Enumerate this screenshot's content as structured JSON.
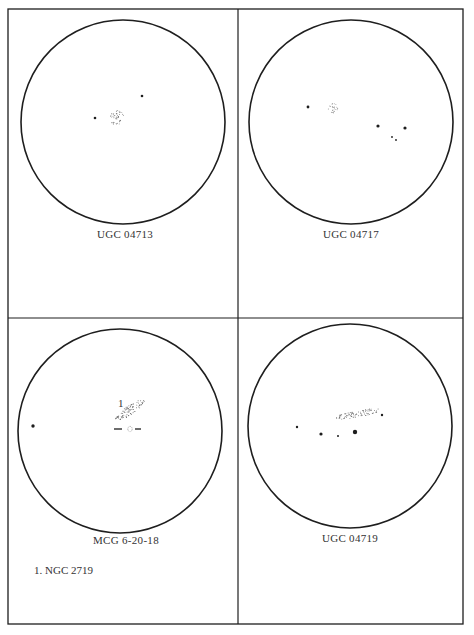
{
  "panels": [
    {
      "id": "top-left",
      "title": "UGC 04713",
      "circle": {
        "cx": 123,
        "cy": 122,
        "r": 102
      },
      "label_pos": {
        "x": 125,
        "y": 236
      },
      "galaxy": {
        "shape": "round",
        "cx": 117,
        "cy": 118,
        "rx": 7,
        "ry": 8,
        "angle": 0
      },
      "stars": [
        {
          "x": 95,
          "y": 118,
          "r": 1.3
        },
        {
          "x": 142,
          "y": 96,
          "r": 1.3
        }
      ]
    },
    {
      "id": "top-right",
      "title": "UGC 04717",
      "circle": {
        "cx": 351,
        "cy": 122,
        "r": 102
      },
      "label_pos": {
        "x": 351,
        "y": 236
      },
      "galaxy": {
        "shape": "round",
        "cx": 333,
        "cy": 108,
        "rx": 5,
        "ry": 5,
        "angle": 0
      },
      "stars": [
        {
          "x": 308,
          "y": 107,
          "r": 1.4
        },
        {
          "x": 378,
          "y": 126,
          "r": 1.6
        },
        {
          "x": 405,
          "y": 128,
          "r": 1.6
        },
        {
          "x": 392,
          "y": 137,
          "r": 0.9
        },
        {
          "x": 396,
          "y": 140,
          "r": 0.9
        }
      ]
    },
    {
      "id": "bottom-left",
      "title": "MCG 6-20-18",
      "circle": {
        "cx": 120,
        "cy": 431,
        "r": 102
      },
      "label_pos": {
        "x": 126,
        "y": 542
      },
      "galaxy": {
        "shape": "elongated",
        "cx": 130,
        "cy": 410,
        "rx": 18,
        "ry": 4.5,
        "angle": -35
      },
      "companion": {
        "x": 130,
        "y": 429,
        "dash_left": [
          114,
          122
        ],
        "dash_right": [
          135,
          141
        ]
      },
      "marker": {
        "text": "1",
        "x": 118,
        "y": 406
      },
      "stars": [
        {
          "x": 33,
          "y": 426,
          "r": 1.7
        }
      ]
    },
    {
      "id": "bottom-right",
      "title": "UGC 04719",
      "circle": {
        "cx": 350,
        "cy": 426,
        "r": 102
      },
      "label_pos": {
        "x": 350,
        "y": 540
      },
      "galaxy": {
        "shape": "elongated",
        "cx": 358,
        "cy": 414,
        "rx": 23,
        "ry": 3.5,
        "angle": -10
      },
      "stars": [
        {
          "x": 297,
          "y": 427,
          "r": 1.2
        },
        {
          "x": 321,
          "y": 434,
          "r": 1.6
        },
        {
          "x": 338,
          "y": 436,
          "r": 1.0
        },
        {
          "x": 355,
          "y": 432,
          "r": 2.2
        },
        {
          "x": 382,
          "y": 415,
          "r": 1.2
        }
      ]
    }
  ],
  "footnote": {
    "text": "1.  NGC 2719",
    "x": 34,
    "y": 572
  },
  "frame": {
    "left": 8,
    "top": 9,
    "right": 463,
    "bottom": 624,
    "mid_x": 238,
    "mid_y": 318
  },
  "colors": {
    "ink": "#1e1e1e",
    "paper": "#ffffff"
  }
}
